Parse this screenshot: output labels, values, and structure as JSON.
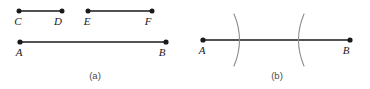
{
  "figure": {
    "background_color": "#ffffff",
    "stroke_color": "#1a1a1a",
    "arc_color": "#8c8c8c",
    "label_color": "#1a1a1a",
    "caption_color": "#4a4a4a",
    "panels": [
      {
        "id": "a",
        "caption": "(a)",
        "caption_x": 95,
        "caption_y": 79,
        "segments": [
          {
            "name": "segment-CD",
            "start_label": "C",
            "end_label": "D",
            "x1": 19,
            "y1": 11,
            "x2": 62,
            "y2": 11,
            "start_label_x": 18,
            "start_label_y": 25,
            "end_label_x": 58,
            "end_label_y": 25,
            "endpoint_dots": 2
          },
          {
            "name": "segment-EF",
            "start_label": "E",
            "end_label": "F",
            "x1": 88,
            "y1": 11,
            "x2": 152,
            "y2": 11,
            "start_label_x": 87,
            "start_label_y": 25,
            "end_label_x": 148,
            "end_label_y": 25,
            "endpoint_dots": 2
          },
          {
            "name": "segment-AB-plain",
            "start_label": "A",
            "end_label": "B",
            "x1": 20,
            "y1": 42,
            "x2": 166,
            "y2": 42,
            "start_label_x": 19,
            "start_label_y": 56,
            "end_label_x": 162,
            "end_label_y": 56,
            "endpoint_dots": 2
          }
        ],
        "arcs": []
      },
      {
        "id": "b",
        "caption": "(b)",
        "caption_x": 277,
        "caption_y": 79,
        "segments": [
          {
            "name": "segment-AB-with-arcs",
            "start_label": "A",
            "end_label": "B",
            "x1": 203,
            "y1": 40,
            "x2": 350,
            "y2": 40,
            "start_label_x": 202,
            "start_label_y": 54,
            "end_label_x": 346,
            "end_label_y": 54,
            "endpoint_dots": 2
          }
        ],
        "arcs": [
          {
            "name": "compass-arc-left",
            "bulge_direction": "right",
            "crossing_x": 241,
            "top_x": 234,
            "top_y": 14,
            "bottom_x": 234,
            "bottom_y": 66
          },
          {
            "name": "compass-arc-right",
            "bulge_direction": "left",
            "crossing_x": 297,
            "top_x": 304,
            "top_y": 14,
            "bottom_x": 304,
            "bottom_y": 66
          }
        ]
      }
    ]
  }
}
